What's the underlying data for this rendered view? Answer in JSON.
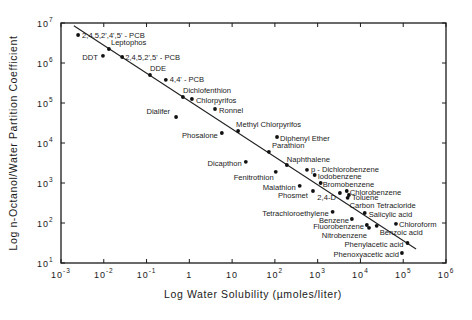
{
  "chart_data": {
    "type": "scatter",
    "title": "",
    "xlabel": "Log Water Solubility (µmoles/liter)",
    "ylabel": "Log n-Octanol/Water Partition Coefficient",
    "xscale": "log",
    "yscale": "log",
    "xlim": [
      0.001,
      1000000
    ],
    "ylim": [
      10,
      10000000
    ],
    "x_ticks": [
      {
        "base": "10",
        "exp": "-3"
      },
      {
        "base": "10",
        "exp": "-2"
      },
      {
        "base": "10",
        "exp": "-1"
      },
      {
        "base": "1",
        "exp": ""
      },
      {
        "base": "10",
        "exp": ""
      },
      {
        "base": "10",
        "exp": "2"
      },
      {
        "base": "10",
        "exp": "3"
      },
      {
        "base": "10",
        "exp": "4"
      },
      {
        "base": "10",
        "exp": "5"
      },
      {
        "base": "10",
        "exp": "6"
      }
    ],
    "y_ticks": [
      {
        "base": "10",
        "exp": "1"
      },
      {
        "base": "10",
        "exp": "2"
      },
      {
        "base": "10",
        "exp": "3"
      },
      {
        "base": "10",
        "exp": "4"
      },
      {
        "base": "10",
        "exp": "5"
      },
      {
        "base": "10",
        "exp": "6"
      },
      {
        "base": "10",
        "exp": "7"
      }
    ],
    "grid": false,
    "legend": null,
    "fit_line": {
      "log_x": [
        -2.7,
        5.3
      ],
      "log_y": [
        6.93,
        1.35
      ]
    },
    "points": [
      {
        "name": "2,4,5,2',4',5' - PCB",
        "log_x": -2.6,
        "log_y": 6.7,
        "label_dx": 4,
        "label_dy": 0,
        "anchor": "start"
      },
      {
        "name": "Leptophos",
        "log_x": -1.88,
        "log_y": 6.35,
        "label_dx": 2,
        "label_dy": -7,
        "anchor": "start"
      },
      {
        "name": "DDT",
        "log_x": -2.02,
        "log_y": 6.18,
        "label_dx": -5,
        "label_dy": 2,
        "anchor": "end"
      },
      {
        "name": "2,4,5,2',5' - PCB",
        "log_x": -1.57,
        "log_y": 6.15,
        "label_dx": 3,
        "label_dy": 0,
        "anchor": "start"
      },
      {
        "name": "DDE",
        "log_x": -0.92,
        "log_y": 5.7,
        "label_dx": 0,
        "label_dy": -7,
        "anchor": "start"
      },
      {
        "name": "4,4' - PCB",
        "log_x": -0.55,
        "log_y": 5.58,
        "label_dx": 4,
        "label_dy": 0,
        "anchor": "start"
      },
      {
        "name": "Dichlofenthion",
        "log_x": -0.15,
        "log_y": 5.15,
        "label_dx": 0,
        "label_dy": -7,
        "anchor": "start"
      },
      {
        "name": "Chlorpyrifos",
        "log_x": 0.06,
        "log_y": 5.1,
        "label_dx": 4,
        "label_dy": 1,
        "anchor": "start"
      },
      {
        "name": "Ronnel",
        "log_x": 0.6,
        "log_y": 4.85,
        "label_dx": 4,
        "label_dy": 1,
        "anchor": "start"
      },
      {
        "name": "Dialifer",
        "log_x": -0.31,
        "log_y": 4.65,
        "label_dx": -6,
        "label_dy": -6,
        "anchor": "end"
      },
      {
        "name": "Phosalone",
        "log_x": 0.76,
        "log_y": 4.25,
        "label_dx": -4,
        "label_dy": 2,
        "anchor": "end"
      },
      {
        "name": "Methyl Chlorpyrifos",
        "log_x": 1.14,
        "log_y": 4.3,
        "label_dx": -2,
        "label_dy": -7,
        "anchor": "start"
      },
      {
        "name": "Diphenyl Ether",
        "log_x": 2.05,
        "log_y": 4.15,
        "label_dx": 3,
        "label_dy": 1,
        "anchor": "start"
      },
      {
        "name": "Parathion",
        "log_x": 1.86,
        "log_y": 3.78,
        "label_dx": 3,
        "label_dy": -6,
        "anchor": "start"
      },
      {
        "name": "Dicapthon",
        "log_x": 1.32,
        "log_y": 3.53,
        "label_dx": -4,
        "label_dy": 2,
        "anchor": "end"
      },
      {
        "name": "Naphthalene",
        "log_x": 2.28,
        "log_y": 3.45,
        "label_dx": 0,
        "label_dy": -6,
        "anchor": "start"
      },
      {
        "name": "Fenitrothion",
        "log_x": 2.02,
        "log_y": 3.28,
        "label_dx": -2,
        "label_dy": 6,
        "anchor": "end"
      },
      {
        "name": "p - Dichlorobenzene",
        "log_x": 2.75,
        "log_y": 3.33,
        "label_dx": 4,
        "label_dy": 0,
        "anchor": "start"
      },
      {
        "name": "Iodobenzene",
        "log_x": 2.93,
        "log_y": 3.2,
        "label_dx": 3,
        "label_dy": 1,
        "anchor": "start"
      },
      {
        "name": "Bromobenzene",
        "log_x": 3.07,
        "log_y": 3.0,
        "label_dx": 2,
        "label_dy": 1,
        "anchor": "start"
      },
      {
        "name": "Malathion",
        "log_x": 2.58,
        "log_y": 2.93,
        "label_dx": -4,
        "label_dy": 2,
        "anchor": "end"
      },
      {
        "name": "Phosmet",
        "log_x": 2.89,
        "log_y": 2.8,
        "label_dx": -5,
        "label_dy": 4,
        "anchor": "end"
      },
      {
        "name": "Chlorobenzene",
        "log_x": 3.68,
        "log_y": 2.8,
        "label_dx": 3,
        "label_dy": 1,
        "anchor": "start"
      },
      {
        "name": "2,4-D",
        "log_x": 3.52,
        "log_y": 2.75,
        "label_dx": -4,
        "label_dy": 4,
        "anchor": "end"
      },
      {
        "name": "Toluene",
        "log_x": 3.73,
        "log_y": 2.7,
        "label_dx": 3,
        "label_dy": 2,
        "anchor": "start"
      },
      {
        "name": "Carbon Tetracloride",
        "log_x": 3.7,
        "log_y": 2.63,
        "label_dx": 2,
        "label_dy": 8,
        "anchor": "start"
      },
      {
        "name": "Tetrachloroethylene",
        "log_x": 3.35,
        "log_y": 2.28,
        "label_dx": -4,
        "label_dy": 2,
        "anchor": "end"
      },
      {
        "name": "Salicylic acid",
        "log_x": 4.1,
        "log_y": 2.25,
        "label_dx": 4,
        "label_dy": 1,
        "anchor": "start"
      },
      {
        "name": "Benzene",
        "log_x": 3.8,
        "log_y": 2.1,
        "label_dx": -3,
        "label_dy": 1,
        "anchor": "end"
      },
      {
        "name": "Chloroform",
        "log_x": 4.83,
        "log_y": 1.98,
        "label_dx": 3,
        "label_dy": 1,
        "anchor": "start"
      },
      {
        "name": "Fluorobenzene",
        "log_x": 4.15,
        "log_y": 1.95,
        "label_dx": -3,
        "label_dy": 1,
        "anchor": "end"
      },
      {
        "name": "Nitrobenzene",
        "log_x": 4.2,
        "log_y": 1.88,
        "label_dx": -2,
        "label_dy": 8,
        "anchor": "end"
      },
      {
        "name": "Benzoic acid",
        "log_x": 4.38,
        "log_y": 1.93,
        "label_dx": 3,
        "label_dy": 7,
        "anchor": "start"
      },
      {
        "name": "Phenylacetic acid",
        "log_x": 5.1,
        "log_y": 1.5,
        "label_dx": -4,
        "label_dy": 1,
        "anchor": "end"
      },
      {
        "name": "Phenoxyacetic acid",
        "log_x": 4.97,
        "log_y": 1.25,
        "label_dx": -3,
        "label_dy": 1,
        "anchor": "end"
      }
    ]
  }
}
